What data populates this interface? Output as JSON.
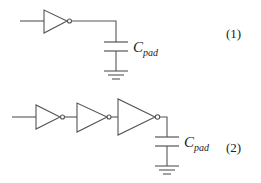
{
  "diagram": {
    "type": "circuit-schematic",
    "circuits": [
      {
        "id": 1,
        "equation_label": "(1)",
        "description": "Single inverter driving pad capacitance",
        "inverter_count": 1,
        "capacitor": {
          "symbol": "C",
          "subscript": "pad"
        },
        "ground": true
      },
      {
        "id": 2,
        "equation_label": "(2)",
        "description": "Chain of three tapered inverters driving pad capacitance",
        "inverter_count": 3,
        "capacitor": {
          "symbol": "C",
          "subscript": "pad"
        },
        "ground": true
      }
    ]
  },
  "labels": {
    "c1_symbol": "C",
    "c1_sub": "pad",
    "c1_eq": "(1)",
    "c2_symbol": "C",
    "c2_sub": "pad",
    "c2_eq": "(2)"
  },
  "colors": {
    "stroke": "#555555",
    "text": "#222222",
    "background": "#ffffff"
  }
}
